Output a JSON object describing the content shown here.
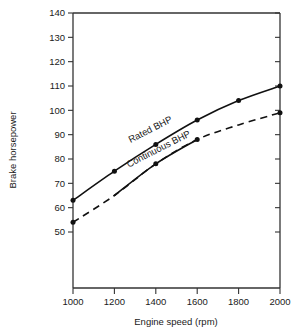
{
  "chart_data": {
    "type": "line",
    "title": "",
    "xlabel": "Engine speed (rpm)",
    "ylabel": "Brake horsepower",
    "x": [
      1000,
      1200,
      1400,
      1600,
      1800,
      2000
    ],
    "xlim": [
      1000,
      2000
    ],
    "ylim": [
      50,
      140
    ],
    "grid": false,
    "legend_position": "inline-curve-labels",
    "xticks": [
      "1000",
      "1200",
      "1400",
      "1600",
      "1800",
      "2000"
    ],
    "yticks": [
      "50",
      "60",
      "70",
      "80",
      "90",
      "100",
      "110",
      "120",
      "130",
      "140"
    ],
    "series": [
      {
        "name": "Rated BHP",
        "style": "solid",
        "markers": true,
        "values": [
          63,
          75,
          86,
          96,
          104,
          110
        ]
      },
      {
        "name": "Continuous BHP",
        "style": "dashed-ends-solid-middle",
        "markers": true,
        "values": [
          54,
          65,
          78,
          88,
          94,
          99
        ]
      }
    ],
    "annotations": [
      {
        "text": "Rated BHP",
        "x": 1380,
        "y": 91,
        "rotation": -27
      },
      {
        "text": "Continuous BHP",
        "x": 1420,
        "y": 83,
        "rotation": -27
      }
    ],
    "colors": {
      "line": "#111111",
      "axis": "#333333",
      "background": "#ffffff",
      "text": "#1a1a1a"
    }
  },
  "axes": {
    "x_title": "Engine speed (rpm)",
    "y_title": "Brake horsepower"
  }
}
